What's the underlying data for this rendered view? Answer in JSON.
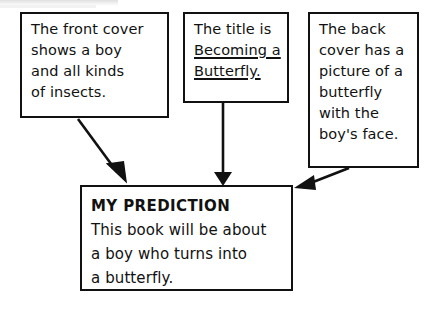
{
  "diagram": {
    "background_color": "#ffffff",
    "line_color": "#111111",
    "boxes": {
      "front_cover": {
        "name": "front-cover-note",
        "lines": [
          "The front cover",
          "shows a boy",
          "and all kinds",
          "of insects."
        ]
      },
      "title_note": {
        "name": "title-note",
        "lines": [
          {
            "text": "The title is",
            "underline": false
          },
          {
            "text": "Becoming a",
            "underline": true
          },
          {
            "text": "Butterfly.",
            "underline": true
          }
        ]
      },
      "back_cover": {
        "name": "back-cover-note",
        "lines": [
          "The back",
          "cover has a",
          "picture of a",
          "butterfly",
          "with the",
          "boy's face."
        ]
      },
      "prediction": {
        "name": "prediction-box",
        "heading": "MY PREDICTION",
        "lines": [
          "This book will be about",
          "a boy who turns into",
          "a butterfly."
        ]
      }
    },
    "arrows": [
      {
        "name": "arrow-front-cover-to-prediction",
        "from": "front_cover",
        "to": "prediction",
        "direction": "diagonal-down-right"
      },
      {
        "name": "arrow-title-to-prediction",
        "from": "title_note",
        "to": "prediction",
        "direction": "straight-down"
      },
      {
        "name": "arrow-back-cover-to-prediction",
        "from": "back_cover",
        "to": "prediction",
        "direction": "diagonal-down-left"
      }
    ]
  }
}
